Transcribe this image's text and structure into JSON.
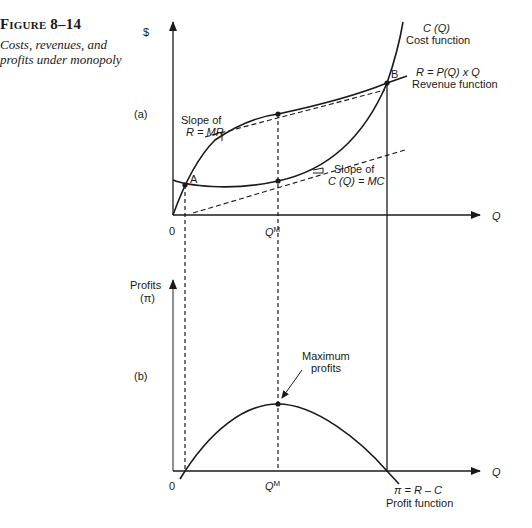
{
  "caption": {
    "figure_number": "Figure 8–14",
    "description": "Costs, revenues, and profits under monopoly"
  },
  "panel_a": {
    "label": "(a)",
    "y_axis_label": "$",
    "x_axis_label": "Q",
    "origin_label": "0",
    "qm_label": "Q",
    "qm_superscript": "M",
    "point_a": "A",
    "point_b": "B",
    "cost_curve": {
      "name": "C (Q)",
      "desc": "Cost function"
    },
    "revenue_curve": {
      "name": "R = P(Q) x Q",
      "desc": "Revenue function"
    },
    "mr_note": {
      "line1": "Slope of",
      "line2": "R = MR"
    },
    "mc_note": {
      "line1": "Slope of",
      "line2": "C (Q) = MC"
    }
  },
  "panel_b": {
    "label": "(b)",
    "y_axis_label_line1": "Profits",
    "y_axis_label_line2": "(π)",
    "x_axis_label": "Q",
    "origin_label": "0",
    "qm_label": "Q",
    "qm_superscript": "M",
    "max_note": {
      "line1": "Maximum",
      "line2": "profits"
    },
    "profit_curve": {
      "name": "π = R – C",
      "desc": "Profit function"
    }
  },
  "colors": {
    "ink": "#1a1a1a",
    "background": "#ffffff"
  }
}
